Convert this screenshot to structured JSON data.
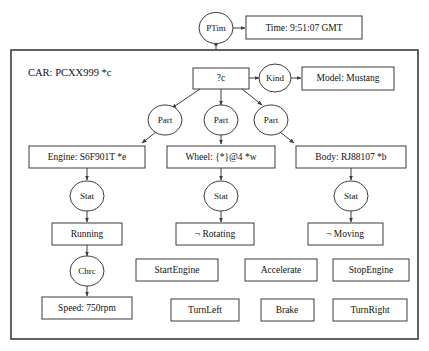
{
  "frame": {
    "title": "CAR: PCXX999 *c"
  },
  "top": {
    "clock_node": "PTim",
    "time_box": "Time: 9:51:07 GMT"
  },
  "root": {
    "variable_box": "?c",
    "kind_node": "Kind",
    "model_box": "Model: Mustang"
  },
  "relations": {
    "part": "Part",
    "stat": "Stat",
    "chrc": "Chrc"
  },
  "components": [
    {
      "part_label": "Part",
      "box": "Engine: S6F901T *e",
      "stat_label": "Stat",
      "status": "Running"
    },
    {
      "part_label": "Part",
      "box": "Wheel: {*}@4 *w",
      "stat_label": "Stat",
      "status": "¬ Rotating"
    },
    {
      "part_label": "Part",
      "box": "Body:  RJ88107 *b",
      "stat_label": "Stat",
      "status": "¬ Moving"
    }
  ],
  "characteristic": {
    "node": "Chrc",
    "box": "Speed: 750rpm"
  },
  "actions_row1": [
    "StartEngine",
    "Accelerate",
    "StopEngine"
  ],
  "actions_row2": [
    "TurnLeft",
    "Brake",
    "TurnRight"
  ],
  "colors": {
    "stroke": "#3c3c3c",
    "text": "#111111",
    "background": "#ffffff"
  }
}
